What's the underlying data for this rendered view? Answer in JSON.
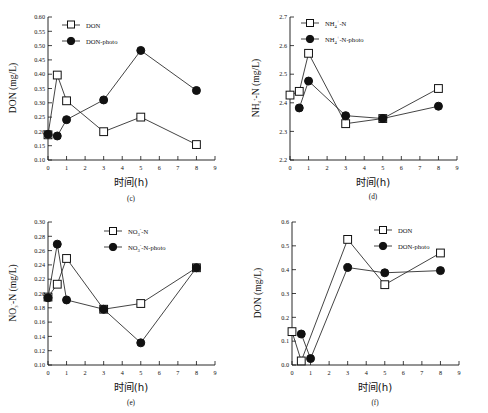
{
  "figure": {
    "title": "",
    "panel_count": 4,
    "xlabel_cn": "时间(h)"
  },
  "chart_data": [
    {
      "type": "line",
      "panel": "(c)",
      "title": "",
      "xlabel": "时间(h)",
      "ylabel": "DON (mg/L)",
      "xlim": [
        0,
        9
      ],
      "ylim": [
        0.1,
        0.6
      ],
      "xticks": [
        0,
        1,
        2,
        3,
        4,
        5,
        6,
        7,
        8,
        9
      ],
      "yticks": [
        0.1,
        0.15,
        0.2,
        0.25,
        0.3,
        0.35,
        0.4,
        0.45,
        0.5,
        0.55,
        0.6
      ],
      "ytick_labels": [
        "0.10",
        "0.15",
        "0.20",
        "0.25",
        "0.30",
        "0.35",
        "0.40",
        "0.45",
        "0.50",
        "0.55",
        "0.60"
      ],
      "grid": false,
      "legend_position": "top-left",
      "series": [
        {
          "name": "DON",
          "marker": "open-square",
          "x": [
            0,
            0.5,
            1,
            3,
            5,
            8
          ],
          "values": [
            0.188,
            0.397,
            0.307,
            0.199,
            0.25,
            0.154
          ]
        },
        {
          "name": "DON-photo",
          "marker": "filled-circle",
          "x": [
            0,
            0.5,
            1,
            3,
            5,
            8
          ],
          "values": [
            0.19,
            0.184,
            0.241,
            0.31,
            0.483,
            0.343
          ]
        }
      ]
    },
    {
      "type": "line",
      "panel": "(d)",
      "title": "",
      "xlabel": "时间(h)",
      "ylabel": "NH4+-N (mg/L)",
      "ylabel_base": "NH",
      "ylabel_sub": "4",
      "ylabel_sup": "+",
      "ylabel_tail": "-N (mg/L)",
      "xlim": [
        0,
        9
      ],
      "ylim": [
        2.2,
        2.7
      ],
      "xticks": [
        0,
        1,
        2,
        3,
        4,
        5,
        6,
        7,
        8,
        9
      ],
      "yticks": [
        2.2,
        2.3,
        2.4,
        2.5,
        2.6,
        2.7
      ],
      "ytick_labels": [
        "2.2",
        "2.3",
        "2.4",
        "2.5",
        "2.6",
        "2.7"
      ],
      "grid": false,
      "legend_position": "top-left",
      "series": [
        {
          "name": "NH4+-N",
          "marker": "open-square",
          "x": [
            0,
            0.5,
            1,
            3,
            5,
            8
          ],
          "values": [
            2.427,
            2.44,
            2.573,
            2.327,
            2.345,
            2.45
          ]
        },
        {
          "name": "NH4+-N-photo",
          "marker": "filled-circle",
          "x": [
            0.5,
            1,
            3,
            5,
            8
          ],
          "values": [
            2.382,
            2.476,
            2.355,
            2.345,
            2.388
          ]
        }
      ]
    },
    {
      "type": "line",
      "panel": "(e)",
      "title": "",
      "xlabel": "时间(h)",
      "ylabel": "NO3--N (mg/L)",
      "ylabel_base": "NO",
      "ylabel_sub": "3",
      "ylabel_sup": "-",
      "ylabel_tail": "-N (mg/L)",
      "xlim": [
        0,
        9
      ],
      "ylim": [
        0.1,
        0.3
      ],
      "xticks": [
        0,
        1,
        2,
        3,
        4,
        5,
        6,
        7,
        8,
        9
      ],
      "yticks": [
        0.1,
        0.12,
        0.14,
        0.16,
        0.18,
        0.2,
        0.22,
        0.24,
        0.26,
        0.28,
        0.3
      ],
      "ytick_labels": [
        "0.10",
        "0.12",
        "0.14",
        "0.16",
        "0.18",
        "0.20",
        "0.22",
        "0.24",
        "0.26",
        "0.28",
        "0.30"
      ],
      "grid": false,
      "legend_position": "top-center",
      "series": [
        {
          "name": "NO3--N",
          "marker": "open-square",
          "x": [
            0,
            0.5,
            1,
            3,
            5,
            8
          ],
          "values": [
            0.195,
            0.213,
            0.249,
            0.178,
            0.186,
            0.236
          ]
        },
        {
          "name": "NO3--N-photo",
          "marker": "filled-circle",
          "x": [
            0,
            0.5,
            1,
            3,
            5,
            8
          ],
          "values": [
            0.194,
            0.269,
            0.191,
            0.178,
            0.131,
            0.236
          ]
        }
      ]
    },
    {
      "type": "line",
      "panel": "(f)",
      "title": "",
      "xlabel": "时间(h)",
      "ylabel": "DON (mg/L)",
      "xlim": [
        0,
        9
      ],
      "ylim": [
        0.0,
        0.6
      ],
      "xticks": [
        0,
        1,
        2,
        3,
        4,
        5,
        6,
        7,
        8,
        9
      ],
      "yticks": [
        0.0,
        0.1,
        0.2,
        0.3,
        0.4,
        0.5,
        0.6
      ],
      "ytick_labels": [
        "0.0",
        "0.1",
        "0.2",
        "0.3",
        "0.4",
        "0.5",
        "0.6"
      ],
      "grid": false,
      "legend_position": "top-right",
      "series": [
        {
          "name": "DON",
          "marker": "open-square",
          "x": [
            0,
            0.5,
            3,
            5,
            8
          ],
          "values": [
            0.14,
            0.017,
            0.527,
            0.337,
            0.47
          ]
        },
        {
          "name": "DON-photo",
          "marker": "filled-circle",
          "x": [
            0.5,
            1,
            3,
            5,
            8
          ],
          "values": [
            0.13,
            0.027,
            0.409,
            0.387,
            0.396
          ]
        }
      ]
    }
  ],
  "panels": {
    "c": {
      "id": "(c)",
      "ylabel": "DON (mg/L)",
      "xlabel": "时间(h)",
      "legend": [
        "DON",
        "DON-photo"
      ]
    },
    "d": {
      "id": "(d)",
      "ylabel_base": "NH",
      "ylabel_sub": "4",
      "ylabel_sup": "+",
      "ylabel_tail": "-N (mg/L)",
      "xlabel": "时间(h)",
      "legend_base_1": "NH",
      "legend_sub_1": "4",
      "legend_sup_1": "+",
      "legend_tail_1": "-N",
      "legend_base_2": "NH",
      "legend_sub_2": "4",
      "legend_sup_2": "+",
      "legend_tail_2": "-N-photo"
    },
    "e": {
      "id": "(e)",
      "ylabel_base": "NO",
      "ylabel_sub": "3",
      "ylabel_sup": "-",
      "ylabel_tail": "-N (mg/L)",
      "xlabel": "时间(h)",
      "legend_base_1": "NO",
      "legend_sub_1": "3",
      "legend_sup_1": "-",
      "legend_tail_1": "-N",
      "legend_base_2": "NO",
      "legend_sub_2": "3",
      "legend_sup_2": "-",
      "legend_tail_2": "-N-photo"
    },
    "f": {
      "id": "(f)",
      "ylabel": "DON (mg/L)",
      "xlabel": "时间(h)",
      "legend": [
        "DON",
        "DON-photo"
      ]
    }
  }
}
